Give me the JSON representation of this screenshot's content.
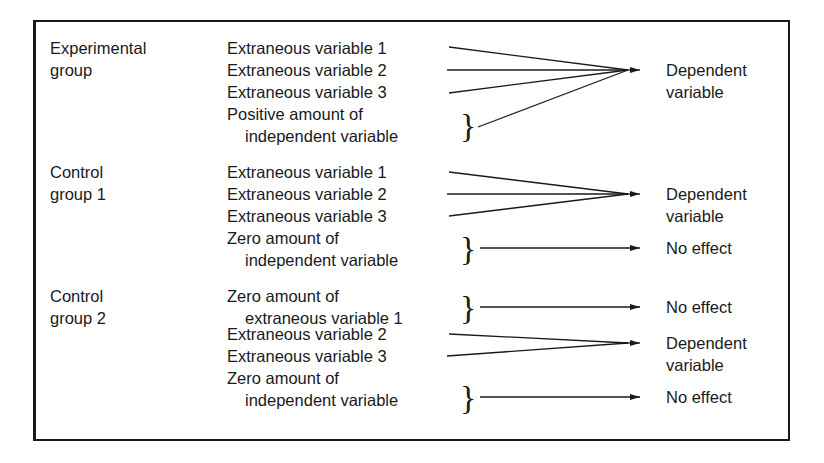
{
  "diagram": {
    "groups": [
      {
        "label_line1": "Experimental",
        "label_line2": "group",
        "inputs": [
          "Extraneous variable 1",
          "Extraneous variable 2",
          "Extraneous variable 3"
        ],
        "iv_line1": "Positive amount of",
        "iv_line2": "independent variable",
        "outcome_line1": "Dependent",
        "outcome_line2": "variable"
      },
      {
        "label_line1": "Control",
        "label_line2": "group 1",
        "inputs": [
          "Extraneous variable 1",
          "Extraneous variable 2",
          "Extraneous variable 3"
        ],
        "iv_line1": "Zero amount of",
        "iv_line2": "independent variable",
        "outcome_line1": "Dependent",
        "outcome_line2": "variable",
        "iv_outcome": "No effect"
      },
      {
        "label_line1": "Control",
        "label_line2": "group 2",
        "ev1_line1": "Zero amount of",
        "ev1_line2": "extraneous variable 1",
        "ev1_outcome": "No effect",
        "inputs": [
          "Extraneous variable 2",
          "Extraneous variable 3"
        ],
        "outcome_line1": "Dependent",
        "outcome_line2": "variable",
        "iv_line1": "Zero amount of",
        "iv_line2": "independent variable",
        "iv_outcome": "No effect"
      }
    ],
    "brace_glyph": "}"
  }
}
